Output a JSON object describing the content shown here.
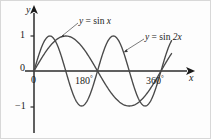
{
  "figure": {
    "name": "sine-curves-graph",
    "background": "#fdfdfd",
    "curve_color": "#4a4a4a",
    "axis_color": "#1a1a1a"
  },
  "axes": {
    "y_axis_label": "y",
    "x_axis_label": "x",
    "origin_label": "0",
    "y_ticks": [
      {
        "label": "1",
        "value": 1
      },
      {
        "label": "0",
        "value": 0
      },
      {
        "label": "−1",
        "value": -1
      }
    ],
    "x_ticks": [
      {
        "label": "0",
        "degrees": 0,
        "suffix": ""
      },
      {
        "label": "180",
        "degrees": 180,
        "suffix": "°"
      },
      {
        "label": "360",
        "degrees": 360,
        "suffix": "°"
      }
    ]
  },
  "curve_labels": [
    {
      "name": "label-sin-x",
      "prefix": "y",
      "eq": " = sin ",
      "arg": "x",
      "text": "y = sin x"
    },
    {
      "name": "label-sin-2x",
      "prefix": "y",
      "eq": " = sin ",
      "arg": "2x",
      "text": "y = sin 2x"
    }
  ],
  "chart_data": {
    "type": "line",
    "title": "",
    "xlabel": "x",
    "ylabel": "y",
    "xlim": [
      -12,
      400
    ],
    "ylim": [
      -1.45,
      1.45
    ],
    "grid": false,
    "legend": "inline-annotations",
    "x_tick_values": [
      0,
      180,
      360
    ],
    "x_tick_labels": [
      "0",
      "180°",
      "360°"
    ],
    "y_tick_values": [
      1,
      0,
      -1
    ],
    "y_tick_labels": [
      "1",
      "0",
      "−1"
    ],
    "series": [
      {
        "name": "y = sin x",
        "formula": "sin(x)",
        "period_degrees": 360,
        "amplitude": 1,
        "color": "#4a4a4a",
        "domain_degrees": [
          0,
          390
        ],
        "key_points": [
          {
            "x": 0,
            "y": 0
          },
          {
            "x": 90,
            "y": 1
          },
          {
            "x": 180,
            "y": 0
          },
          {
            "x": 270,
            "y": -1
          },
          {
            "x": 360,
            "y": 0
          }
        ],
        "annotation": {
          "text": "y = sin x",
          "points_to_x": 100,
          "points_to_y": 0.985
        }
      },
      {
        "name": "y = sin 2x",
        "formula": "sin(2x)",
        "period_degrees": 180,
        "amplitude": 1,
        "color": "#4a4a4a",
        "domain_degrees": [
          0,
          390
        ],
        "key_points": [
          {
            "x": 0,
            "y": 0
          },
          {
            "x": 45,
            "y": 1
          },
          {
            "x": 90,
            "y": 0
          },
          {
            "x": 135,
            "y": -1
          },
          {
            "x": 180,
            "y": 0
          },
          {
            "x": 225,
            "y": 1
          },
          {
            "x": 270,
            "y": 0
          },
          {
            "x": 315,
            "y": -1
          },
          {
            "x": 360,
            "y": 0
          }
        ],
        "annotation": {
          "text": "y = sin 2x",
          "points_to_x": 247,
          "points_to_y": 0.68
        }
      }
    ]
  }
}
